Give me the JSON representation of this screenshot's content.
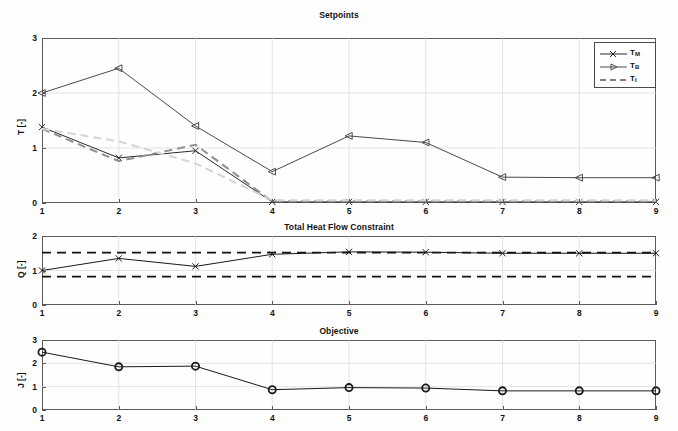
{
  "figure": {
    "width": 678,
    "height": 431,
    "background": "#ffffff"
  },
  "colors": {
    "axis": "#5a5a5a",
    "grid": "#d8d8d8",
    "series_dark": "#2b2b2b",
    "series_gray": "#8f8f8f",
    "series_light": "#cfcfcf",
    "constraint": "#111111",
    "text": "#111111"
  },
  "chart_data": [
    {
      "type": "line",
      "title": "Setpoints",
      "xlabel": "",
      "ylabel": "T [-]",
      "x": [
        1,
        2,
        3,
        4,
        5,
        6,
        7,
        8,
        9
      ],
      "xlim": [
        1,
        9
      ],
      "ylim": [
        0,
        3
      ],
      "xticks": [
        1,
        2,
        3,
        4,
        5,
        6,
        7,
        8,
        9
      ],
      "yticks": [
        0,
        1,
        2,
        3
      ],
      "grid": true,
      "legend_position": "top-right",
      "series": [
        {
          "name": "T_M",
          "legend_label": "T",
          "legend_sub": "M",
          "marker": "x",
          "linestyle": "solid",
          "color": "#2b2b2b",
          "values": [
            1.38,
            0.82,
            0.95,
            0.02,
            0.02,
            0.02,
            0.02,
            0.02,
            0.02
          ]
        },
        {
          "name": "T_B",
          "legend_label": "T",
          "legend_sub": "B",
          "marker": "triangle-left",
          "linestyle": "solid",
          "color": "#4a4a4a",
          "values": [
            2.0,
            2.45,
            1.4,
            0.57,
            1.22,
            1.1,
            0.47,
            0.46,
            0.46
          ]
        },
        {
          "name": "T_I",
          "legend_label": "T",
          "legend_sub": "I",
          "marker": "none",
          "linestyle": "dashed",
          "color": "#8f8f8f",
          "values": [
            1.35,
            0.76,
            1.06,
            0.03,
            0.03,
            0.03,
            0.03,
            0.03,
            0.03
          ]
        },
        {
          "name": "T_I_aux",
          "legend_label": "",
          "legend_sub": "",
          "marker": "none",
          "linestyle": "dashed",
          "color": "#d4d4d4",
          "values": [
            1.35,
            1.12,
            0.72,
            0.05,
            0.05,
            0.05,
            0.05,
            0.05,
            0.05
          ]
        }
      ]
    },
    {
      "type": "line",
      "title": "Total Heat Flow Constraint",
      "xlabel": "",
      "ylabel": "Q [-]",
      "x": [
        1,
        2,
        3,
        4,
        5,
        6,
        7,
        8,
        9
      ],
      "xlim": [
        1,
        9
      ],
      "ylim": [
        0,
        2
      ],
      "xticks": [
        1,
        2,
        3,
        4,
        5,
        6,
        7,
        8,
        9
      ],
      "yticks": [
        0,
        1,
        2
      ],
      "grid": true,
      "series": [
        {
          "name": "Q",
          "marker": "x",
          "linestyle": "solid",
          "color": "#1a1a1a",
          "values": [
            1.0,
            1.35,
            1.12,
            1.47,
            1.54,
            1.53,
            1.5,
            1.5,
            1.5
          ]
        }
      ],
      "constraints": [
        {
          "name": "upper-bound",
          "value": 1.52,
          "linestyle": "dashed",
          "color": "#111111"
        },
        {
          "name": "lower-bound",
          "value": 0.82,
          "linestyle": "dashed",
          "color": "#111111"
        }
      ]
    },
    {
      "type": "line",
      "title": "Objective",
      "xlabel": "",
      "ylabel": "J [-]",
      "x": [
        1,
        2,
        3,
        4,
        5,
        6,
        7,
        8,
        9
      ],
      "xlim": [
        1,
        9
      ],
      "ylim": [
        0,
        3
      ],
      "xticks": [
        1,
        2,
        3,
        4,
        5,
        6,
        7,
        8,
        9
      ],
      "yticks": [
        0,
        1,
        2,
        3
      ],
      "grid": true,
      "series": [
        {
          "name": "J",
          "marker": "circle",
          "linestyle": "solid",
          "color": "#1a1a1a",
          "values": [
            2.48,
            1.85,
            1.88,
            0.87,
            0.96,
            0.94,
            0.82,
            0.82,
            0.82
          ]
        }
      ]
    }
  ],
  "panels": {
    "setpoints": {
      "title": "Setpoints",
      "ylabel": "T [-]",
      "yticks": [
        "0",
        "1",
        "2",
        "3"
      ],
      "xticks": [
        "1",
        "2",
        "3",
        "4",
        "5",
        "6",
        "7",
        "8",
        "9"
      ]
    },
    "heatflow": {
      "title": "Total Heat Flow Constraint",
      "ylabel": "Q [-]",
      "yticks": [
        "0",
        "1",
        "2"
      ],
      "xticks": [
        "1",
        "2",
        "3",
        "4",
        "5",
        "6",
        "7",
        "8",
        "9"
      ]
    },
    "objective": {
      "title": "Objective",
      "ylabel": "J [-]",
      "yticks": [
        "0",
        "1",
        "2",
        "3"
      ],
      "xticks": [
        "1",
        "2",
        "3",
        "4",
        "5",
        "6",
        "7",
        "8",
        "9"
      ]
    }
  },
  "legend": {
    "entries": [
      {
        "base": "T",
        "sub": "M",
        "marker": "x",
        "linestyle": "solid"
      },
      {
        "base": "T",
        "sub": "B",
        "marker": "triangle-left",
        "linestyle": "solid"
      },
      {
        "base": "T",
        "sub": "I",
        "marker": "none",
        "linestyle": "dashed"
      }
    ]
  }
}
